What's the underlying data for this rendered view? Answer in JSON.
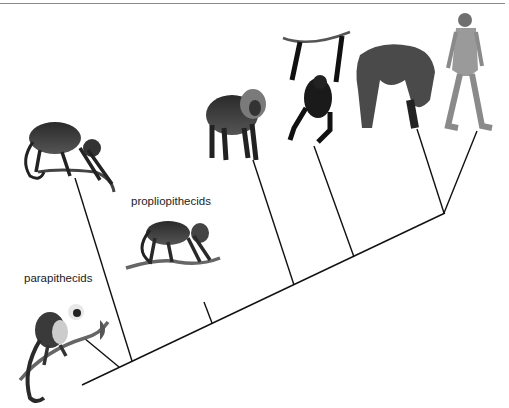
{
  "figure": {
    "type": "cladogram",
    "labels": {
      "parapithecids": "parapithecids",
      "propliopithecids": "propliopithecids"
    },
    "taxa": [
      {
        "id": "parapithecid",
        "label": "parapithecids",
        "illustration": "squirrel-monkey-like primate on branch"
      },
      {
        "id": "new-world-monkey",
        "label": "",
        "illustration": "spider-monkey-like primate on branch"
      },
      {
        "id": "propliopithecid",
        "label": "propliopithecids",
        "illustration": "monkey on branch"
      },
      {
        "id": "old-world-monkey",
        "label": "",
        "illustration": "mandrill-like monkey standing"
      },
      {
        "id": "gibbon",
        "label": "",
        "illustration": "ape hanging from vine"
      },
      {
        "id": "gorilla",
        "label": "",
        "illustration": "gorilla knuckle-walking"
      },
      {
        "id": "human",
        "label": "",
        "illustration": "human walking"
      }
    ],
    "colors": {
      "line": "#111111",
      "rule": "#8a8a8a"
    }
  }
}
